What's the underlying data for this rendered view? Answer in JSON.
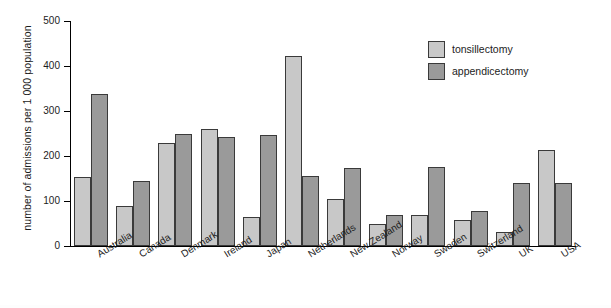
{
  "chart_data": {
    "type": "bar",
    "title": "",
    "xlabel": "",
    "ylabel": "number of admissions per 1 000 population",
    "ylim": [
      0,
      500
    ],
    "yticks": [
      0,
      100,
      200,
      300,
      400,
      500
    ],
    "grid": false,
    "legend_position": "top-right",
    "categories": [
      "Australia",
      "Canada",
      "Denmark",
      "Ireland",
      "Japan",
      "Netherlands",
      "New Zealand",
      "Norway",
      "Sweden",
      "Switzerland",
      "UK",
      "USA"
    ],
    "series": [
      {
        "name": "tonsillectomy",
        "color": "#c8c8c8",
        "values": [
          153,
          90,
          230,
          260,
          65,
          422,
          105,
          50,
          70,
          58,
          32,
          213
        ]
      },
      {
        "name": "appendicectomy",
        "color": "#9a9a9a",
        "values": [
          338,
          145,
          250,
          243,
          247,
          155,
          173,
          70,
          175,
          78,
          140,
          139
        ]
      }
    ]
  },
  "legend": {
    "items": [
      {
        "label": "tonsillectomy",
        "swatch": "tons"
      },
      {
        "label": "appendicectomy",
        "swatch": "appe"
      }
    ]
  },
  "axes": {
    "y_title": "number of admissions per 1 000 population",
    "y_tick_labels": [
      "0",
      "100",
      "200",
      "300",
      "400",
      "500"
    ]
  }
}
